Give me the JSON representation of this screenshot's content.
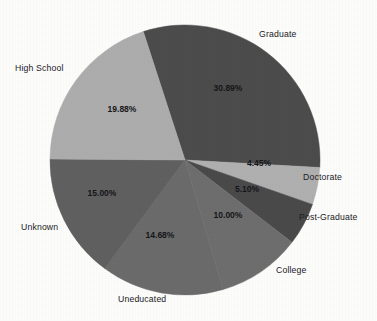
{
  "chart_data": {
    "type": "pie",
    "title": "",
    "subtitle": "",
    "xlabel": "",
    "ylabel": "",
    "legend_position": "none",
    "grid": false,
    "label_format": "percent",
    "start_angle_deg": -18,
    "direction": "clockwise",
    "categories": [
      "Graduate",
      "Doctorate",
      "Post-Graduate",
      "College",
      "Uneducated",
      "Unknown",
      "High School"
    ],
    "values": [
      30.89,
      4.45,
      5.1,
      10.0,
      14.68,
      15.0,
      19.88
    ],
    "value_labels": [
      "30.89%",
      "4.45%",
      "5.10%",
      "10.00%",
      "14.68%",
      "15.00%",
      "19.88%"
    ],
    "colors": [
      "#4c4c4c",
      "#b0b0b0",
      "#4a4a4a",
      "#6e6e6e",
      "#6b6b6b",
      "#606060",
      "#adadad"
    ],
    "total": 100.0,
    "slices": [
      {
        "label": "Graduate",
        "value": 30.89,
        "value_label": "30.89%",
        "color": "#4c4c4c"
      },
      {
        "label": "Doctorate",
        "value": 4.45,
        "value_label": "4.45%",
        "color": "#b0b0b0"
      },
      {
        "label": "Post-Graduate",
        "value": 5.1,
        "value_label": "5.10%",
        "color": "#4a4a4a"
      },
      {
        "label": "College",
        "value": 10.0,
        "value_label": "10.00%",
        "color": "#6e6e6e"
      },
      {
        "label": "Uneducated",
        "value": 14.68,
        "value_label": "14.68%",
        "color": "#6b6b6b"
      },
      {
        "label": "Unknown",
        "value": 15.0,
        "value_label": "15.00%",
        "color": "#606060"
      },
      {
        "label": "High School",
        "value": 19.88,
        "value_label": "19.88%",
        "color": "#adadad"
      }
    ]
  },
  "outer_labels": [
    {
      "name": "graduate",
      "text": "Graduate",
      "x": 259,
      "y": 29
    },
    {
      "name": "doctorate",
      "text": "Doctorate",
      "x": 303,
      "y": 172
    },
    {
      "name": "post-graduate",
      "text": "Post-Graduate",
      "x": 299,
      "y": 212
    },
    {
      "name": "college",
      "text": "College",
      "x": 276,
      "y": 265
    },
    {
      "name": "uneducated",
      "text": "Uneducated",
      "x": 118,
      "y": 294
    },
    {
      "name": "unknown",
      "text": "Unknown",
      "x": 21,
      "y": 222
    },
    {
      "name": "high-school",
      "text": "High School",
      "x": 15,
      "y": 63
    }
  ],
  "value_labels_positions": [
    {
      "name": "graduate",
      "text": "30.89%",
      "x": 228,
      "y": 91
    },
    {
      "name": "doctorate",
      "text": "4.45%",
      "x": 259,
      "y": 166
    },
    {
      "name": "post-graduate",
      "text": "5.10%",
      "x": 247,
      "y": 192
    },
    {
      "name": "college",
      "text": "10.00%",
      "x": 228,
      "y": 218
    },
    {
      "name": "uneducated",
      "text": "14.68%",
      "x": 160,
      "y": 238
    },
    {
      "name": "unknown",
      "text": "15.00%",
      "x": 102,
      "y": 196
    },
    {
      "name": "high-school",
      "text": "19.88%",
      "x": 122,
      "y": 112
    }
  ],
  "geometry": {
    "center_x": 185,
    "center_y": 160,
    "radius": 135
  },
  "background_color": "#fdfdfb"
}
